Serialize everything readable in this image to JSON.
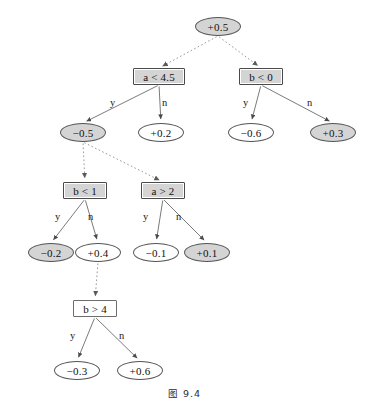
{
  "figure": {
    "caption": "图 9.4",
    "colors": {
      "shaded_fill": "#d4d4d4",
      "plain_fill": "#ffffff",
      "stroke": "#555555",
      "text": "#101010",
      "dotted_edge": "#9a9a9a",
      "solid_edge": "#6b6b6b"
    }
  },
  "chart_data": {
    "type": "diagram",
    "title": "图 9.4",
    "subtype": "boosted-decision-tree",
    "nodes": [
      {
        "id": "root",
        "label": "+0.5",
        "shape": "ellipse",
        "fill": "shaded",
        "x": 195,
        "y": 17,
        "w": 46,
        "h": 19
      },
      {
        "id": "a45",
        "label": "a < 4.5",
        "shape": "box",
        "fill": "shaded",
        "x": 133,
        "y": 68,
        "w": 52,
        "h": 17
      },
      {
        "id": "b0",
        "label": "b < 0",
        "shape": "box",
        "fill": "shaded",
        "x": 239,
        "y": 68,
        "w": 44,
        "h": 17
      },
      {
        "id": "m05",
        "label": "−0.5",
        "shape": "ellipse",
        "fill": "shaded",
        "x": 60,
        "y": 123,
        "w": 46,
        "h": 19
      },
      {
        "id": "p02",
        "label": "+0.2",
        "shape": "ellipse",
        "fill": "plain",
        "x": 138,
        "y": 123,
        "w": 46,
        "h": 19
      },
      {
        "id": "m06",
        "label": "−0.6",
        "shape": "ellipse",
        "fill": "plain",
        "x": 228,
        "y": 123,
        "w": 46,
        "h": 19
      },
      {
        "id": "p03",
        "label": "+0.3",
        "shape": "ellipse",
        "fill": "shaded",
        "x": 310,
        "y": 123,
        "w": 46,
        "h": 19
      },
      {
        "id": "b1",
        "label": "b < 1",
        "shape": "box",
        "fill": "shaded",
        "x": 63,
        "y": 182,
        "w": 44,
        "h": 17
      },
      {
        "id": "a2",
        "label": "a > 2",
        "shape": "box",
        "fill": "shaded",
        "x": 141,
        "y": 182,
        "w": 44,
        "h": 17
      },
      {
        "id": "m02",
        "label": "−0.2",
        "shape": "ellipse",
        "fill": "shaded",
        "x": 28,
        "y": 243,
        "w": 46,
        "h": 19
      },
      {
        "id": "p04",
        "label": "+0.4",
        "shape": "ellipse",
        "fill": "plain",
        "x": 75,
        "y": 243,
        "w": 46,
        "h": 19
      },
      {
        "id": "m01",
        "label": "−0.1",
        "shape": "ellipse",
        "fill": "plain",
        "x": 133,
        "y": 243,
        "w": 46,
        "h": 19
      },
      {
        "id": "p01",
        "label": "+0.1",
        "shape": "ellipse",
        "fill": "shaded",
        "x": 184,
        "y": 243,
        "w": 46,
        "h": 19
      },
      {
        "id": "b4",
        "label": "b > 4",
        "shape": "box",
        "fill": "plain",
        "x": 73,
        "y": 300,
        "w": 44,
        "h": 17
      },
      {
        "id": "m03",
        "label": "−0.3",
        "shape": "ellipse",
        "fill": "plain",
        "x": 54,
        "y": 361,
        "w": 46,
        "h": 19
      },
      {
        "id": "p06",
        "label": "+0.6",
        "shape": "ellipse",
        "fill": "plain",
        "x": 117,
        "y": 361,
        "w": 46,
        "h": 19
      }
    ],
    "edges": [
      {
        "from": "root",
        "to": "a45",
        "style": "dotted",
        "label": ""
      },
      {
        "from": "root",
        "to": "b0",
        "style": "dotted",
        "label": ""
      },
      {
        "from": "a45",
        "to": "m05",
        "style": "solid",
        "label": "y"
      },
      {
        "from": "a45",
        "to": "p02",
        "style": "solid",
        "label": "n"
      },
      {
        "from": "b0",
        "to": "m06",
        "style": "solid",
        "label": "y"
      },
      {
        "from": "b0",
        "to": "p03",
        "style": "solid",
        "label": "n"
      },
      {
        "from": "m05",
        "to": "b1",
        "style": "dotted",
        "label": ""
      },
      {
        "from": "m05",
        "to": "a2",
        "style": "dotted",
        "label": ""
      },
      {
        "from": "b1",
        "to": "m02",
        "style": "solid",
        "label": "y"
      },
      {
        "from": "b1",
        "to": "p04",
        "style": "solid",
        "label": "n"
      },
      {
        "from": "a2",
        "to": "m01",
        "style": "solid",
        "label": "y"
      },
      {
        "from": "a2",
        "to": "p01",
        "style": "solid",
        "label": "n"
      },
      {
        "from": "p04",
        "to": "b4",
        "style": "dotted",
        "label": ""
      },
      {
        "from": "b4",
        "to": "m03",
        "style": "solid",
        "label": "y"
      },
      {
        "from": "b4",
        "to": "p06",
        "style": "solid",
        "label": "n"
      }
    ],
    "edge_labels": [
      {
        "text": "y",
        "x": 110,
        "y": 97
      },
      {
        "text": "n",
        "x": 162,
        "y": 97
      },
      {
        "text": "y",
        "x": 243,
        "y": 97
      },
      {
        "text": "n",
        "x": 307,
        "y": 97
      },
      {
        "text": "y",
        "x": 55,
        "y": 211
      },
      {
        "text": "n",
        "x": 88,
        "y": 211
      },
      {
        "text": "y",
        "x": 143,
        "y": 211
      },
      {
        "text": "n",
        "x": 176,
        "y": 211
      },
      {
        "text": "y",
        "x": 70,
        "y": 330
      },
      {
        "text": "n",
        "x": 119,
        "y": 330
      }
    ]
  }
}
